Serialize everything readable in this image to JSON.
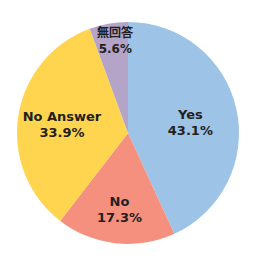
{
  "chart_data": {
    "type": "pie",
    "title": "",
    "start_angle": "top",
    "direction": "clockwise",
    "slices": [
      {
        "label": "Yes",
        "value": 43.1,
        "display": "43.1%",
        "color": "#9dc3e6"
      },
      {
        "label": "No",
        "value": 17.3,
        "display": "17.3%",
        "color": "#f5907e"
      },
      {
        "label": "No Answer",
        "value": 33.9,
        "display": "33.9%",
        "color": "#ffd54f"
      },
      {
        "label": "無回答",
        "value": 5.6,
        "display": "5.6%",
        "color": "#b3a4c8"
      }
    ],
    "legend": "none"
  }
}
